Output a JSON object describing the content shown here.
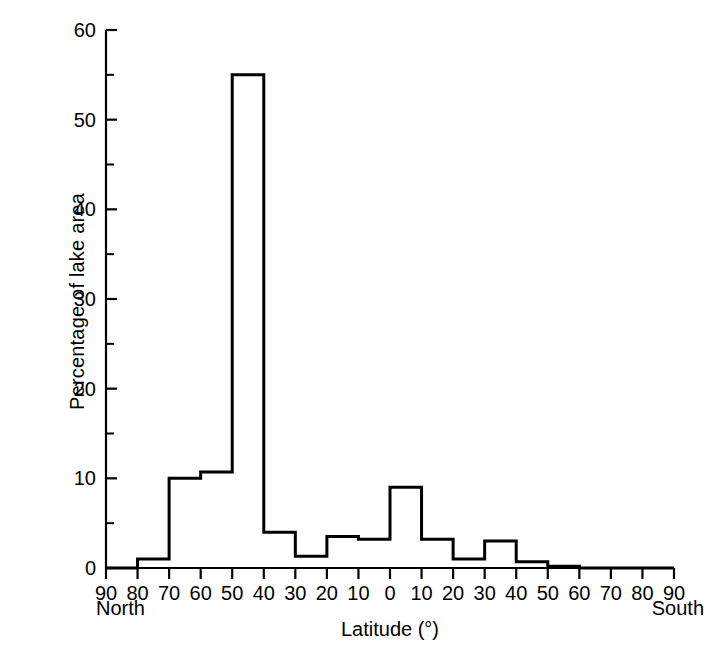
{
  "chart_data": {
    "type": "bar",
    "title": "",
    "subtitle": "",
    "xlabel": "Latitude (°)",
    "ylabel": "Percentage of lake area",
    "x_left_annotation": "North",
    "x_right_annotation": "South",
    "grid": false,
    "legend": null,
    "line_color": "#000000",
    "background_color": "#ffffff",
    "xlim": [
      -90,
      90
    ],
    "ylim": [
      0,
      60
    ],
    "y_major_ticks": [
      0,
      10,
      20,
      30,
      40,
      50,
      60
    ],
    "y_minor_ticks": [
      5,
      15,
      25,
      35,
      45,
      55
    ],
    "y_tick_labels": [
      "0",
      "10",
      "20",
      "30",
      "40",
      "50",
      "60"
    ],
    "x_tick_values": [
      -90,
      -80,
      -70,
      -60,
      -50,
      -40,
      -30,
      -20,
      -10,
      0,
      10,
      20,
      30,
      40,
      50,
      60,
      70,
      80,
      90
    ],
    "x_tick_labels": [
      "90",
      "80",
      "70",
      "60",
      "50",
      "40",
      "30",
      "20",
      "10",
      "0",
      "10",
      "20",
      "30",
      "40",
      "50",
      "60",
      "70",
      "80",
      "90"
    ],
    "bin_width": 10,
    "bin_edges": [
      -90,
      -80,
      -70,
      -60,
      -50,
      -40,
      -30,
      -20,
      -10,
      0,
      10,
      20,
      30,
      40,
      50,
      60,
      70,
      80,
      90
    ],
    "categories": [
      "90-80 N",
      "80-70 N",
      "70-60 N",
      "60-50 N",
      "50-40 N",
      "40-30 N",
      "30-20 N",
      "20-10 N",
      "10-0 N",
      "0-10 S",
      "10-20 S",
      "20-30 S",
      "30-40 S",
      "40-50 S",
      "50-60 S",
      "60-70 S",
      "70-80 S",
      "80-90 S"
    ],
    "values": [
      0,
      1,
      10,
      10.7,
      55,
      4,
      1.3,
      3.5,
      3.2,
      9,
      3.2,
      1,
      3,
      0.7,
      0.2,
      0,
      0,
      0
    ],
    "series": [
      {
        "name": "Percentage of lake area",
        "values": [
          0,
          1,
          10,
          10.7,
          55,
          4,
          1.3,
          3.5,
          3.2,
          9,
          3.2,
          1,
          3,
          0.7,
          0.2,
          0,
          0,
          0
        ]
      }
    ]
  }
}
